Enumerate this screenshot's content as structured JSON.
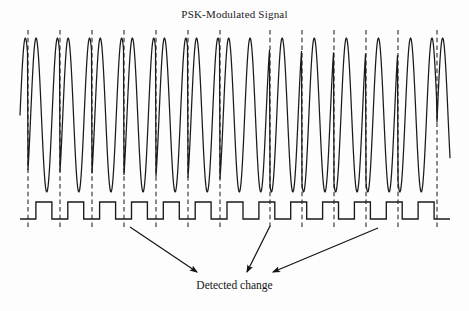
{
  "figure": {
    "title": "PSK-Modulated Signal",
    "caption": "Detected change",
    "background_color": "#fdfdfd",
    "ink_color": "#1a1a1a",
    "gridline_color": "#2b2b2b"
  },
  "chart_data": {
    "type": "line",
    "title": "PSK-Modulated Signal",
    "xlabel": "",
    "ylabel": "",
    "grid": true,
    "legend_position": "none",
    "annotations": [
      {
        "text": "Detected change",
        "x": 234,
        "y": 288
      }
    ],
    "axis": {
      "x_range": [
        20,
        450
      ],
      "carrier_y_range": [
        38,
        192
      ],
      "digital_low_y": 219,
      "digital_high_y": 202
    },
    "symbol_boundaries_x": [
      28,
      60,
      92,
      124,
      156,
      188,
      220,
      270,
      302,
      334,
      366,
      398,
      437
    ],
    "series": [
      {
        "name": "PSK carrier",
        "type": "sine-phase-shift-keyed",
        "amplitude": 77,
        "center_y": 115,
        "cycles_per_symbol": 1.5,
        "phase_flips_at": [
          28,
          60,
          92,
          124,
          156,
          188,
          220,
          270,
          302,
          334,
          366,
          398,
          437
        ],
        "description": "Sinusoidal carrier whose phase inverts at selected symbol boundaries"
      },
      {
        "name": "Digital baseband",
        "type": "square",
        "low_level": 0,
        "high_level": 1,
        "bits": [
          0,
          1,
          0,
          1,
          0,
          1,
          0,
          1,
          0,
          1,
          0,
          1,
          0,
          1,
          0,
          1,
          0,
          1,
          0,
          1,
          0,
          1,
          0,
          1,
          0,
          1,
          0
        ],
        "description": "Recovered binary waveform beneath the carrier"
      }
    ],
    "arrows": [
      {
        "name": "arrow-1",
        "from_x": 130,
        "from_y": 227,
        "to_x": 197,
        "to_y": 272
      },
      {
        "name": "arrow-2",
        "from_x": 270,
        "from_y": 226,
        "to_x": 247,
        "to_y": 272
      },
      {
        "name": "arrow-3",
        "from_x": 378,
        "from_y": 228,
        "to_x": 273,
        "to_y": 272
      }
    ]
  }
}
